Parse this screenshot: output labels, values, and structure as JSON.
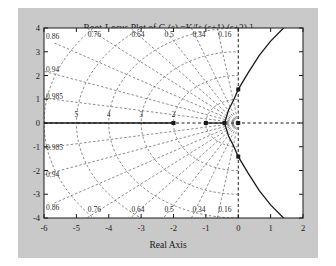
{
  "figure": {
    "background_color": "#c9c9c9",
    "axes_background_color": "#ffffff",
    "line_color": "#1a1a1a",
    "grid_color": "#555555"
  },
  "chart_data": {
    "type": "line",
    "title": "Root-Locus Plot of G (s) =K/[s (s+1) (s+2) ]",
    "xlabel": "Real Axis",
    "ylabel": "Imag Axis",
    "xlim": [
      -6,
      2
    ],
    "ylim": [
      -4,
      4
    ],
    "xticks": [
      "-6",
      "-5",
      "-4",
      "-3",
      "-2",
      "-1",
      "0",
      "1",
      "2"
    ],
    "xtick_values": [
      -6,
      -5,
      -4,
      -3,
      -2,
      -1,
      0,
      1,
      2
    ],
    "yticks": [
      "4",
      "3",
      "2",
      "1",
      "0",
      "-1",
      "-2",
      "-3",
      "-4"
    ],
    "ytick_values": [
      4,
      3,
      2,
      1,
      0,
      -1,
      -2,
      -3,
      -4
    ],
    "grid": false,
    "legend": "none",
    "transfer_function": "G(s) = K / [s (s+1) (s+2)]",
    "open_loop_poles": [
      {
        "real": 0,
        "imag": 0
      },
      {
        "real": -1,
        "imag": 0
      },
      {
        "real": -2,
        "imag": 0
      }
    ],
    "asymptote_centroid": -1,
    "breakaway_point": -0.4226,
    "jw_axis_crossing": {
      "real": 0,
      "imag": 1.4142,
      "gain_K": 6
    },
    "damping_grid_labels": [
      "0.16",
      "0.34",
      "0.5",
      "0.64",
      "0.76",
      "0.86",
      "0.94",
      "0.985"
    ],
    "damping_grid_values": [
      0.16,
      0.34,
      0.5,
      0.64,
      0.76,
      0.86,
      0.94,
      0.985
    ],
    "natural_frequency_labels": [
      "2",
      "3",
      "4",
      "5"
    ],
    "natural_frequency_values": [
      2,
      3,
      4,
      5
    ],
    "branches": [
      {
        "name": "real-axis-branch-left",
        "description": "Real axis segment from pole at -2 toward -infinity",
        "points": [
          [
            -2,
            0
          ],
          [
            -6,
            0
          ]
        ]
      },
      {
        "name": "real-axis-branch-center",
        "description": "Real axis segment between pole -1 and breakaway point",
        "points": [
          [
            -1,
            0
          ],
          [
            -0.4226,
            0
          ]
        ]
      },
      {
        "name": "complex-branch-upper",
        "description": "Branch leaving breakaway into upper half plane, crossing jw axis at j1.414",
        "points": [
          [
            -0.4226,
            0
          ],
          [
            -0.3,
            0.55
          ],
          [
            -0.15,
            0.95
          ],
          [
            0.0,
            1.414
          ],
          [
            0.3,
            2.1
          ],
          [
            0.65,
            2.85
          ],
          [
            1.0,
            3.45
          ],
          [
            1.4,
            4.0
          ]
        ]
      },
      {
        "name": "complex-branch-lower",
        "description": "Branch leaving breakaway into lower half plane, crossing jw axis at -j1.414",
        "points": [
          [
            -0.4226,
            0
          ],
          [
            -0.3,
            -0.55
          ],
          [
            -0.15,
            -0.95
          ],
          [
            0.0,
            -1.414
          ],
          [
            0.3,
            -2.1
          ],
          [
            0.65,
            -2.85
          ],
          [
            1.0,
            -3.45
          ],
          [
            1.4,
            -4.0
          ]
        ]
      }
    ],
    "markers": [
      {
        "real": -2,
        "imag": 0,
        "shape": "square"
      },
      {
        "real": -1,
        "imag": 0,
        "shape": "square"
      },
      {
        "real": -0.4226,
        "imag": 0,
        "shape": "square"
      },
      {
        "real": 0,
        "imag": 0,
        "shape": "square"
      },
      {
        "real": 0,
        "imag": 1.4142,
        "shape": "square"
      },
      {
        "real": 0,
        "imag": -1.4142,
        "shape": "square"
      }
    ]
  }
}
